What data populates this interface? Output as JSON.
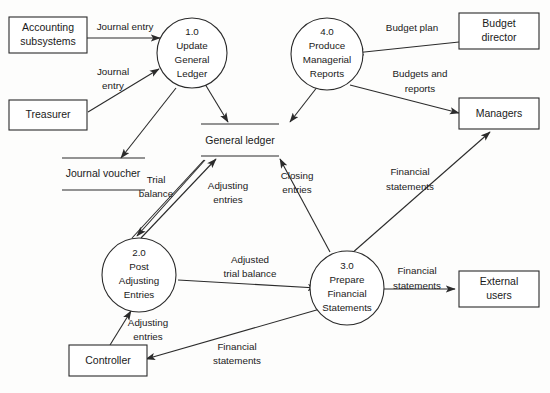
{
  "diagram": {
    "type": "data-flow-diagram",
    "colors": {
      "stroke": "#2b2b2b",
      "background": "#fdfdfc",
      "text": "#1a1a1a"
    }
  },
  "entities": [
    {
      "id": "accounting-subsystems",
      "line1": "Accounting",
      "line2": "subsystems"
    },
    {
      "id": "treasurer",
      "line1": "Treasurer",
      "line2": ""
    },
    {
      "id": "controller",
      "line1": "Controller",
      "line2": ""
    },
    {
      "id": "budget-director",
      "line1": "Budget",
      "line2": "director"
    },
    {
      "id": "managers",
      "line1": "Managers",
      "line2": ""
    },
    {
      "id": "external-users",
      "line1": "External",
      "line2": "users"
    }
  ],
  "processes": [
    {
      "id": "process-1",
      "number": "1.0",
      "l1": "Update",
      "l2": "General",
      "l3": "Ledger",
      "l4": ""
    },
    {
      "id": "process-2",
      "number": "2.0",
      "l1": "Post",
      "l2": "Adjusting",
      "l3": "Entries",
      "l4": ""
    },
    {
      "id": "process-3",
      "number": "3.0",
      "l1": "Prepare",
      "l2": "Financial",
      "l3": "Statements",
      "l4": ""
    },
    {
      "id": "process-4",
      "number": "4.0",
      "l1": "Produce",
      "l2": "Managerial",
      "l3": "Reports",
      "l4": ""
    }
  ],
  "datastores": [
    {
      "id": "general-ledger",
      "label": "General ledger"
    },
    {
      "id": "journal-voucher",
      "label": "Journal voucher"
    }
  ],
  "flows": [
    {
      "id": "flow-journal-entry-subsystems",
      "l1": "Journal entry",
      "l2": ""
    },
    {
      "id": "flow-journal-entry-treasurer",
      "l1": "Journal",
      "l2": "entry"
    },
    {
      "id": "flow-trial-balance",
      "l1": "Trial",
      "l2": "balance"
    },
    {
      "id": "flow-adjusting-entries-gl",
      "l1": "Adjusting",
      "l2": "entries"
    },
    {
      "id": "flow-closing-entries",
      "l1": "Closing",
      "l2": "entries"
    },
    {
      "id": "flow-adjusted-trial-balance",
      "l1": "Adjusted",
      "l2": "trial balance"
    },
    {
      "id": "flow-adjusting-entries-controller",
      "l1": "Adjusting",
      "l2": "entries"
    },
    {
      "id": "flow-financial-statements-controller",
      "l1": "Financial",
      "l2": "statements"
    },
    {
      "id": "flow-financial-statements-external",
      "l1": "Financial",
      "l2": "statements"
    },
    {
      "id": "flow-financial-statements-managers",
      "l1": "Financial",
      "l2": "statements"
    },
    {
      "id": "flow-budget-plan",
      "l1": "Budget plan",
      "l2": ""
    },
    {
      "id": "flow-budgets-and-reports",
      "l1": "Budgets and",
      "l2": "reports"
    }
  ]
}
